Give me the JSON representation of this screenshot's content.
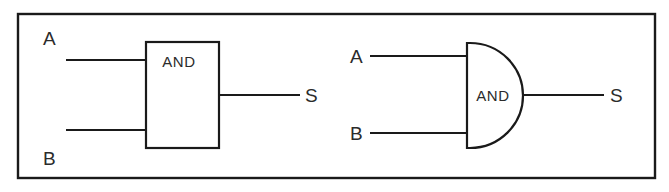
{
  "figure": {
    "background_color": "#ffffff",
    "line_color": "#1a1a1a",
    "text_color": "#2b2b2b",
    "frame": {
      "name": "outer-border",
      "x": 17,
      "y": 13,
      "width": 638,
      "height": 165
    },
    "diagrams": [
      {
        "id": "rectangular",
        "symbol_style": "rectangular-iec-box",
        "gate_label": "AND",
        "inputs": [
          {
            "label": "A",
            "line_y": 60
          },
          {
            "label": "B",
            "line_y": 130
          }
        ],
        "output": {
          "label": "S",
          "line_y": 95
        }
      },
      {
        "id": "distinctive",
        "symbol_style": "distinctive-d-shape",
        "gate_label": "AND",
        "inputs": [
          {
            "label": "A",
            "line_y": 56
          },
          {
            "label": "B",
            "line_y": 133
          }
        ],
        "output": {
          "label": "S",
          "line_y": 95
        }
      }
    ]
  }
}
